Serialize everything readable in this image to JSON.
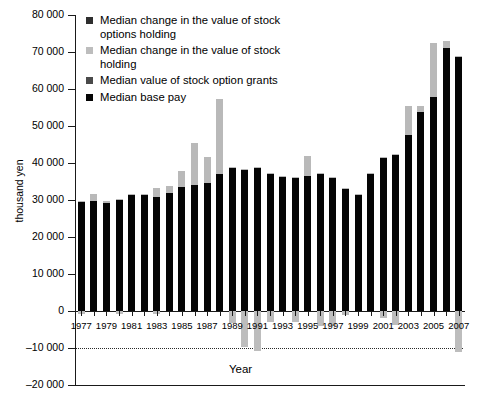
{
  "chart_data": {
    "type": "bar",
    "stacked": true,
    "title": "",
    "xlabel": "Year",
    "ylabel": "thousand yen",
    "ylim": [
      -20000,
      80000
    ],
    "ytick_labels": [
      "80 000",
      "70 000",
      "60 000",
      "50 000",
      "40 000",
      "30 000",
      "20 000",
      "10 000",
      "0",
      "–10 000",
      "–20 000"
    ],
    "ytick_values": [
      80000,
      70000,
      60000,
      50000,
      40000,
      30000,
      20000,
      10000,
      0,
      -10000,
      -20000
    ],
    "grid": false,
    "legend_position": "top-left",
    "guide_lines": [
      {
        "value": -10000,
        "style": "dotted"
      }
    ],
    "categories": [
      "1977",
      "1978",
      "1979",
      "1980",
      "1981",
      "1982",
      "1983",
      "1984",
      "1985",
      "1986",
      "1987",
      "1988",
      "1989",
      "1990",
      "1991",
      "1992",
      "1993",
      "1994",
      "1995",
      "1996",
      "1997",
      "1998",
      "1999",
      "2000",
      "2001",
      "2002",
      "2003",
      "2004",
      "2005",
      "2006",
      "2007"
    ],
    "xtick_labels_shown": [
      "1977",
      "1979",
      "1981",
      "1983",
      "1985",
      "1987",
      "1989",
      "1991",
      "1993",
      "1995",
      "1997",
      "1999",
      "2001",
      "2003",
      "2005",
      "2007"
    ],
    "series": [
      {
        "name": "Median base pay",
        "color": "#050505",
        "values": [
          29500,
          29700,
          29300,
          30100,
          31300,
          31400,
          30900,
          32000,
          33600,
          34100,
          34700,
          36900,
          38700,
          38300,
          38900,
          37300,
          36500,
          36000,
          36500,
          37200,
          36200,
          33100,
          31500,
          37100,
          41400,
          42300,
          47700,
          53900,
          57800,
          71200,
          68700
        ]
      },
      {
        "name": "Median value of stock option grants",
        "color": "#3a3a3a",
        "values": [
          0,
          0,
          0,
          0,
          0,
          0,
          0,
          0,
          0,
          0,
          0,
          0,
          0,
          0,
          0,
          0,
          0,
          0,
          0,
          0,
          0,
          0,
          0,
          0,
          0,
          0,
          0,
          0,
          0,
          0,
          0
        ]
      },
      {
        "name": "Median change in the value of stock holding",
        "color": "#bdbdbd",
        "values": [
          200,
          2000,
          300,
          200,
          200,
          250,
          2300,
          1800,
          4200,
          11300,
          7000,
          20500,
          100,
          100,
          100,
          100,
          100,
          100,
          5300,
          100,
          100,
          100,
          100,
          100,
          100,
          100,
          7800,
          1500,
          14700,
          1700,
          100
        ]
      },
      {
        "name": "Median change in the value of stock options holding",
        "color": "#2e2e2e",
        "values": [
          0,
          0,
          0,
          0,
          0,
          0,
          0,
          0,
          0,
          0,
          0,
          0,
          0,
          0,
          0,
          0,
          0,
          0,
          0,
          0,
          0,
          0,
          0,
          0,
          0,
          0,
          0,
          0,
          0,
          0,
          0
        ]
      }
    ],
    "negative_values": [
      {
        "category": "1977",
        "value": -700,
        "series": "Median change in the value of stock holding"
      },
      {
        "category": "1980",
        "value": -900,
        "series": "Median change in the value of stock holding"
      },
      {
        "category": "1983",
        "value": -900,
        "series": "Median change in the value of stock holding"
      },
      {
        "category": "1989",
        "value": -3200,
        "series": "Median change in the value of stock holding"
      },
      {
        "category": "1990",
        "value": -9600,
        "series": "Median change in the value of stock holding"
      },
      {
        "category": "1991",
        "value": -10900,
        "series": "Median change in the value of stock holding"
      },
      {
        "category": "1992",
        "value": -2900,
        "series": "Median change in the value of stock holding"
      },
      {
        "category": "1994",
        "value": -2900,
        "series": "Median change in the value of stock holding"
      },
      {
        "category": "1996",
        "value": -4100,
        "series": "Median change in the value of stock holding"
      },
      {
        "category": "1997",
        "value": -4000,
        "series": "Median change in the value of stock holding"
      },
      {
        "category": "1998",
        "value": -1100,
        "series": "Median change in the value of stock holding"
      },
      {
        "category": "2001",
        "value": -1800,
        "series": "Median change in the value of stock holding"
      },
      {
        "category": "2002",
        "value": -3800,
        "series": "Median change in the value of stock holding"
      },
      {
        "category": "2007",
        "value": -11200,
        "series": "Median change in the value of stock holding"
      }
    ]
  },
  "legend": {
    "items": [
      {
        "label": "Median change in the value of stock options holding",
        "swatch": "sw-optchg"
      },
      {
        "label": "Median change in the value of stock holding",
        "swatch": "sw-stockchg"
      },
      {
        "label": "Median value of stock option grants",
        "swatch": "sw-grants"
      },
      {
        "label": "Median base pay",
        "swatch": "sw-base"
      }
    ]
  },
  "axes": {
    "y_title": "thousand yen",
    "x_title": "Year"
  }
}
